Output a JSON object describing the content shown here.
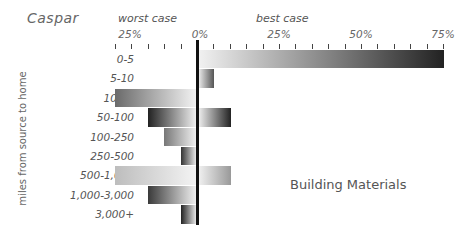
{
  "chart_data": {
    "type": "bar",
    "orientation": "horizontal-diverging",
    "title": "Caspar",
    "annotation": "Building Materials",
    "ylabel": "miles from source to home",
    "left_caption": "worst case",
    "right_caption": "best case",
    "categories": [
      "0-5",
      "5-10",
      "10-50",
      "50-100",
      "100-250",
      "250-500",
      "500-1,000",
      "1,000-3,000",
      "3,000+"
    ],
    "series": [
      {
        "name": "worst case",
        "unit": "%",
        "values": [
          0,
          0,
          25,
          15,
          10,
          5,
          25,
          15,
          5
        ]
      },
      {
        "name": "best case",
        "unit": "%",
        "values": [
          75,
          5,
          0,
          10,
          0,
          0,
          10,
          0,
          0
        ]
      }
    ],
    "x_ticks_left": [
      "25%",
      "0%"
    ],
    "x_ticks_right": [
      "25%",
      "50%",
      "75%"
    ],
    "xlim_left": [
      25,
      0
    ],
    "xlim_right": [
      0,
      75
    ],
    "grid": false
  },
  "layout": {
    "zero_x": 197,
    "px_per_pct": 3.28,
    "row_top": 50,
    "row_h": 19.4
  },
  "bar_shades": {
    "worst": [
      "#888",
      "#888",
      "#6a6a6a",
      "#222",
      "#777",
      "#333",
      "#bdbdbd",
      "#3a3a3a",
      "#222"
    ],
    "best": [
      "#222",
      "#555",
      "#888",
      "#222",
      "#888",
      "#888",
      "#999",
      "#888",
      "#888"
    ]
  }
}
